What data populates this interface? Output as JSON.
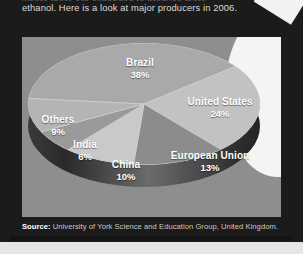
{
  "article": {
    "intro_clipped_line": "where there are expanded to produce more",
    "intro_text": "ethanol. Here is a look at major producers in 2006."
  },
  "source": {
    "label": "Source:",
    "text": " University of York Science and Education Group, United Kingdom."
  },
  "colors": {
    "panel_background": "#1b1b1b",
    "chart_background": "#8e8e8e",
    "label_text": "#ffffff",
    "pie_side": "#2e2e2e",
    "brazil": "#a9a9a9",
    "united_states": "#c2c2c2",
    "european_union": "#8c8c8c",
    "china": "#c9c9c9",
    "india": "#9a9a9a",
    "others": "#b4b4b4"
  },
  "chart_data": {
    "type": "pie",
    "title": "",
    "xlabel": "",
    "ylabel": "",
    "unit": "%",
    "legend_position": "inside-slices",
    "grid": false,
    "categories": [
      "Brazil",
      "United States",
      "European Union",
      "China",
      "India",
      "Others"
    ],
    "values": [
      38,
      24,
      13,
      10,
      6,
      9
    ],
    "labels": [
      {
        "name": "Brazil",
        "pct": "38%",
        "value": 38
      },
      {
        "name": "United States",
        "pct": "24%",
        "value": 24
      },
      {
        "name": "European Union",
        "pct": "13%",
        "value": 13
      },
      {
        "name": "China",
        "pct": "10%",
        "value": 10
      },
      {
        "name": "India",
        "pct": "6%",
        "value": 6
      },
      {
        "name": "Others",
        "pct": "9%",
        "value": 9
      }
    ]
  }
}
